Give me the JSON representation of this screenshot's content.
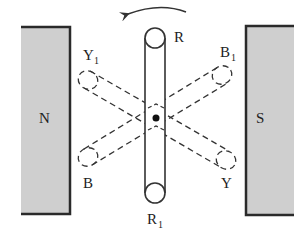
{
  "diagram": {
    "title": "",
    "magnets": {
      "north": {
        "label": "N",
        "fill": "#cfcfcf"
      },
      "south": {
        "label": "S",
        "fill": "#cfcfcf"
      }
    },
    "coils": [
      {
        "name": "RR1",
        "start_label": "R",
        "end_label": "R",
        "end_sub": "1",
        "style": "solid",
        "orientation": "vertical"
      },
      {
        "name": "BB1",
        "start_label": "B",
        "end_label": "B",
        "end_sub": "1",
        "style": "dashed",
        "orientation": "rotated +30deg"
      },
      {
        "name": "YY1",
        "start_label": "Y",
        "end_label": "Y",
        "end_sub": "1",
        "style": "dashed",
        "orientation": "rotated -30deg"
      }
    ],
    "rotation_direction": "anticlockwise",
    "pivot": "center-axis-dot",
    "colors": {
      "line": "#333333",
      "magnet_fill": "#cfcfcf",
      "background": "#ffffff"
    }
  }
}
